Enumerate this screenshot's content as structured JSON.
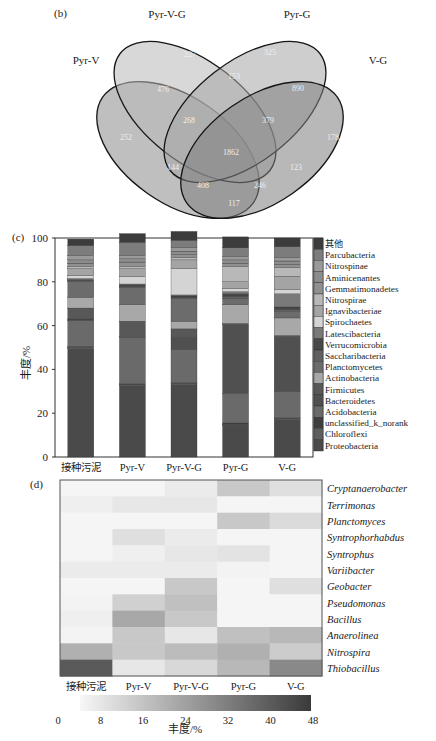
{
  "panels": {
    "b": "(b)",
    "c": "(c)",
    "d": "(d)"
  },
  "chart_data": [
    {
      "type": "venn",
      "panel": "(b)",
      "sets": [
        "Pyr-V",
        "Pyr-V-G",
        "Pyr-G",
        "V-G"
      ],
      "regions": [
        {
          "sets": [
            "Pyr-V"
          ],
          "value": "252"
        },
        {
          "sets": [
            "Pyr-V-G"
          ],
          "value": "227"
        },
        {
          "sets": [
            "Pyr-G"
          ],
          "value": "325"
        },
        {
          "sets": [
            "V-G"
          ],
          "value": "178"
        },
        {
          "sets": [
            "Pyr-V",
            "Pyr-V-G"
          ],
          "value": "476"
        },
        {
          "sets": [
            "Pyr-V-G",
            "Pyr-G"
          ],
          "value": "153"
        },
        {
          "sets": [
            "Pyr-G",
            "V-G"
          ],
          "value": "890"
        },
        {
          "sets": [
            "Pyr-V",
            "Pyr-V-G",
            "Pyr-G"
          ],
          "value": "268"
        },
        {
          "sets": [
            "Pyr-V-G",
            "Pyr-G",
            "V-G"
          ],
          "value": "379"
        },
        {
          "sets": [
            "Pyr-V",
            "Pyr-V-G",
            "Pyr-G",
            "V-G"
          ],
          "value": "1862"
        },
        {
          "sets": [
            "Pyr-V",
            "Pyr-G"
          ],
          "value": "144"
        },
        {
          "sets": [
            "Pyr-V-G",
            "V-G"
          ],
          "value": "123"
        },
        {
          "sets": [
            "Pyr-V",
            "Pyr-G",
            "V-G"
          ],
          "value": "408"
        },
        {
          "sets": [
            "Pyr-V",
            "Pyr-V-G",
            "V-G"
          ],
          "value": "246"
        },
        {
          "sets": [
            "Pyr-V",
            "V-G"
          ],
          "value": "117"
        }
      ]
    },
    {
      "type": "bar",
      "stacked": true,
      "panel": "(c)",
      "title": "",
      "xlabel": "",
      "ylabel": "丰度/%",
      "ylim": [
        0,
        100
      ],
      "yticks": [
        "0",
        "20",
        "40",
        "60",
        "80",
        "100"
      ],
      "categories": [
        "接种污泥",
        "Pyr-V",
        "Pyr-V-G",
        "Pyr-G",
        "V-G"
      ],
      "legend_position": "right",
      "series": [
        {
          "name": "Proteobacteria",
          "color": "#4a4a4a",
          "values": [
            49.5,
            32.5,
            33,
            14.5,
            17
          ]
        },
        {
          "name": "Chloroflexi",
          "color": "#5e5e5e",
          "values": [
            0.5,
            0.5,
            0.5,
            0.5,
            0.5
          ]
        },
        {
          "name": "unclassified_k_norank",
          "color": "#3e3e3e",
          "values": [
            0.5,
            0.5,
            0.5,
            0.5,
            0.5
          ]
        },
        {
          "name": "Acidobacteria",
          "color": "#6a6a6a",
          "values": [
            12,
            21,
            15,
            13.5,
            12
          ]
        },
        {
          "name": "Bacteroidetes",
          "color": "#505050",
          "values": [
            0.5,
            0.5,
            6,
            31.5,
            25
          ]
        },
        {
          "name": "Firmicutes",
          "color": "#585858",
          "values": [
            5,
            7,
            3.5,
            0.5,
            0.5
          ]
        },
        {
          "name": "Actinobacteria",
          "color": "#a8a8a8",
          "values": [
            5,
            7.5,
            3.5,
            8.5,
            8
          ]
        },
        {
          "name": "Planctomycetes",
          "color": "#6c6c6c",
          "values": [
            7,
            8,
            10.5,
            3,
            3
          ]
        },
        {
          "name": "Saccharibacteria",
          "color": "#606060",
          "values": [
            0.5,
            0.5,
            0.5,
            1,
            1
          ]
        },
        {
          "name": "Verrucomicrobia",
          "color": "#484848",
          "values": [
            0.5,
            0.5,
            0.5,
            1,
            1
          ]
        },
        {
          "name": "Latescibacteria",
          "color": "#7a7a7a",
          "values": [
            0.5,
            0.5,
            0.5,
            1,
            6
          ]
        },
        {
          "name": "Spirochaetes",
          "color": "#d4d4d4",
          "values": [
            1.5,
            3.5,
            12,
            1.5,
            2
          ]
        },
        {
          "name": "Ignavibacteriae",
          "color": "#a4a4a4",
          "values": [
            3,
            3.5,
            4,
            3,
            6
          ]
        },
        {
          "name": "Nitrospirae",
          "color": "#b8b8b8",
          "values": [
            1,
            1,
            1,
            7,
            4
          ]
        },
        {
          "name": "Gemmatimonadetes",
          "color": "#909090",
          "values": [
            1.5,
            2,
            1.5,
            1.5,
            1.5
          ]
        },
        {
          "name": "Aminicenantes",
          "color": "#8c8c8c",
          "values": [
            1.5,
            1.5,
            1.5,
            1.5,
            1.5
          ]
        },
        {
          "name": "Nitrospinae",
          "color": "#9a9a9a",
          "values": [
            2,
            1.5,
            1.5,
            1.5,
            1.5
          ]
        },
        {
          "name": "Parcubacteria",
          "color": "#7c7c7c",
          "values": [
            4.5,
            6,
            3.5,
            4,
            5
          ]
        },
        {
          "name": "其他",
          "color": "#3c3c3c",
          "values": [
            3,
            4,
            4,
            5,
            4
          ]
        }
      ]
    },
    {
      "type": "heatmap",
      "panel": "(d)",
      "columns": [
        "接种污泥",
        "Pyr-V",
        "Pyr-V-G",
        "Pyr-G",
        "V-G"
      ],
      "rows": [
        "Cryptanaerobacter",
        "Terrimonas",
        "Planctomyces",
        "Syntrophorhabdus",
        "Syntrophus",
        "Variibacter",
        "Geobacter",
        "Pseudomonas",
        "Bacillus",
        "Anaerolinea",
        "Nitrospira",
        "Thiobacillus"
      ],
      "values": [
        [
          0.5,
          0.5,
          3,
          12,
          6
        ],
        [
          2,
          4,
          4,
          0.5,
          0.5
        ],
        [
          0.5,
          0.5,
          0.5,
          12,
          7
        ],
        [
          0.5,
          6,
          3,
          0.5,
          0.5
        ],
        [
          0.5,
          2,
          4,
          5,
          0.5
        ],
        [
          3,
          3,
          3,
          1,
          0.5
        ],
        [
          0.5,
          0.5,
          12,
          0.5,
          6
        ],
        [
          1,
          10,
          14,
          0.5,
          0.5
        ],
        [
          2,
          20,
          12,
          0.5,
          0.5
        ],
        [
          1,
          12,
          4,
          14,
          16
        ],
        [
          18,
          12,
          15,
          18,
          11
        ],
        [
          40,
          4,
          8,
          16,
          28
        ]
      ],
      "colorbar": {
        "label": "丰度/%",
        "range": [
          0,
          48
        ],
        "ticks": [
          "0",
          "8",
          "16",
          "24",
          "32",
          "40",
          "48"
        ],
        "low_color": "#f7f7f7",
        "high_color": "#3a3a3a"
      }
    }
  ]
}
